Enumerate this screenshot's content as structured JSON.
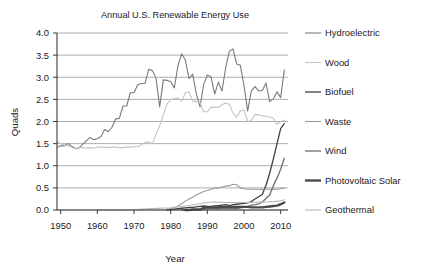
{
  "chart_data": {
    "type": "line",
    "title": "Annual U.S. Renewable  Energy Use",
    "xlabel": "Year",
    "ylabel": "Quads",
    "xlim": [
      1949,
      2012
    ],
    "ylim": [
      0.0,
      4.0
    ],
    "grid": true,
    "legend_position": "right",
    "x_ticks": [
      "1950",
      "1960",
      "1970",
      "1980",
      "1990",
      "2000",
      "2010"
    ],
    "x_tick_values": [
      1950,
      1960,
      1970,
      1980,
      1990,
      2000,
      2010
    ],
    "y_ticks": [
      "0.0",
      "0.5",
      "1.0",
      "1.5",
      "2.0",
      "2.5",
      "3.0",
      "3.5",
      "4.0"
    ],
    "y_tick_values": [
      0.0,
      0.5,
      1.0,
      1.5,
      2.0,
      2.5,
      3.0,
      3.5,
      4.0
    ],
    "series": [
      {
        "name": "Hydroelectric",
        "color": "#7a7a7a",
        "width": 1.1,
        "x": [
          1949,
          1950,
          1951,
          1952,
          1953,
          1954,
          1955,
          1956,
          1957,
          1958,
          1959,
          1960,
          1961,
          1962,
          1963,
          1964,
          1965,
          1966,
          1967,
          1968,
          1969,
          1970,
          1971,
          1972,
          1973,
          1974,
          1975,
          1976,
          1977,
          1978,
          1979,
          1980,
          1981,
          1982,
          1983,
          1984,
          1985,
          1986,
          1987,
          1988,
          1989,
          1990,
          1991,
          1992,
          1993,
          1994,
          1995,
          1996,
          1997,
          1998,
          1999,
          2000,
          2001,
          2002,
          2003,
          2004,
          2005,
          2006,
          2007,
          2008,
          2009,
          2010,
          2011
        ],
        "y": [
          1.42,
          1.45,
          1.45,
          1.5,
          1.44,
          1.39,
          1.4,
          1.49,
          1.56,
          1.64,
          1.59,
          1.61,
          1.66,
          1.82,
          1.77,
          1.87,
          2.06,
          2.07,
          2.35,
          2.35,
          2.65,
          2.65,
          2.83,
          2.86,
          2.86,
          3.18,
          3.15,
          2.98,
          2.33,
          2.94,
          2.93,
          2.9,
          2.76,
          3.27,
          3.53,
          3.39,
          2.97,
          3.07,
          2.63,
          2.33,
          2.84,
          3.05,
          3.01,
          2.62,
          2.89,
          2.69,
          3.21,
          3.59,
          3.64,
          3.3,
          3.27,
          2.81,
          2.24,
          2.69,
          2.79,
          2.69,
          2.7,
          2.87,
          2.45,
          2.51,
          2.67,
          2.54,
          3.17
        ]
      },
      {
        "name": "Wood",
        "color": "#c4c4c4",
        "width": 1.1,
        "x": [
          1949,
          1950,
          1951,
          1952,
          1953,
          1954,
          1955,
          1956,
          1957,
          1958,
          1959,
          1960,
          1961,
          1962,
          1963,
          1964,
          1965,
          1966,
          1967,
          1968,
          1969,
          1970,
          1971,
          1972,
          1973,
          1974,
          1975,
          1976,
          1977,
          1978,
          1979,
          1980,
          1981,
          1982,
          1983,
          1984,
          1985,
          1986,
          1987,
          1988,
          1989,
          1990,
          1991,
          1992,
          1993,
          1994,
          1995,
          1996,
          1997,
          1998,
          1999,
          2000,
          2001,
          2002,
          2003,
          2004,
          2005,
          2006,
          2007,
          2008,
          2009,
          2010,
          2011
        ],
        "y": [
          1.55,
          1.5,
          1.47,
          1.45,
          1.42,
          1.38,
          1.42,
          1.41,
          1.4,
          1.41,
          1.4,
          1.42,
          1.42,
          1.42,
          1.41,
          1.42,
          1.42,
          1.41,
          1.41,
          1.42,
          1.42,
          1.43,
          1.43,
          1.47,
          1.53,
          1.54,
          1.5,
          1.71,
          1.9,
          2.15,
          2.4,
          2.49,
          2.52,
          2.53,
          2.46,
          2.65,
          2.67,
          2.46,
          2.45,
          2.43,
          2.22,
          2.22,
          2.32,
          2.32,
          2.32,
          2.38,
          2.42,
          2.39,
          2.19,
          2.1,
          2.24,
          2.26,
          2.0,
          2.02,
          2.16,
          2.15,
          2.13,
          2.12,
          2.1,
          2.08,
          1.93,
          2.0,
          2.03
        ]
      },
      {
        "name": "Biofuel",
        "color": "#3f3f3f",
        "width": 1.3,
        "x": [
          1979,
          1980,
          1981,
          1982,
          1983,
          1984,
          1985,
          1986,
          1987,
          1988,
          1989,
          1990,
          1991,
          1992,
          1993,
          1994,
          1995,
          1996,
          1997,
          1998,
          1999,
          2000,
          2001,
          2002,
          2003,
          2004,
          2005,
          2006,
          2007,
          2008,
          2009,
          2010,
          2011
        ],
        "y": [
          0.0,
          0.01,
          0.02,
          0.03,
          0.04,
          0.05,
          0.06,
          0.06,
          0.07,
          0.08,
          0.09,
          0.08,
          0.08,
          0.09,
          0.1,
          0.11,
          0.12,
          0.1,
          0.12,
          0.13,
          0.14,
          0.15,
          0.16,
          0.19,
          0.25,
          0.3,
          0.35,
          0.56,
          0.83,
          1.15,
          1.5,
          1.84,
          1.95
        ]
      },
      {
        "name": "Waste",
        "color": "#9a9a9a",
        "width": 1.1,
        "x": [
          1979,
          1980,
          1981,
          1982,
          1983,
          1984,
          1985,
          1986,
          1987,
          1988,
          1989,
          1990,
          1991,
          1992,
          1993,
          1994,
          1995,
          1996,
          1997,
          1998,
          1999,
          2000,
          2001,
          2002,
          2003,
          2004,
          2005,
          2006,
          2007,
          2008,
          2009,
          2010,
          2011
        ],
        "y": [
          0.02,
          0.03,
          0.05,
          0.09,
          0.14,
          0.2,
          0.25,
          0.29,
          0.34,
          0.38,
          0.42,
          0.44,
          0.47,
          0.49,
          0.5,
          0.52,
          0.54,
          0.55,
          0.58,
          0.57,
          0.5,
          0.48,
          0.47,
          0.47,
          0.47,
          0.47,
          0.46,
          0.47,
          0.47,
          0.47,
          0.47,
          0.48,
          0.5
        ]
      },
      {
        "name": "Wind",
        "color": "#6e6e6e",
        "width": 1.3,
        "x": [
          1983,
          1984,
          1985,
          1986,
          1987,
          1988,
          1989,
          1990,
          1991,
          1992,
          1993,
          1994,
          1995,
          1996,
          1997,
          1998,
          1999,
          2000,
          2001,
          2002,
          2003,
          2004,
          2005,
          2006,
          2007,
          2008,
          2009,
          2010,
          2011
        ],
        "y": [
          0.0,
          0.0,
          0.01,
          0.01,
          0.01,
          0.01,
          0.02,
          0.03,
          0.03,
          0.03,
          0.03,
          0.04,
          0.03,
          0.03,
          0.03,
          0.03,
          0.05,
          0.06,
          0.07,
          0.11,
          0.12,
          0.14,
          0.18,
          0.26,
          0.34,
          0.55,
          0.72,
          0.92,
          1.17
        ]
      },
      {
        "name": "Photovoltaic Solar",
        "color": "#4a4a4a",
        "width": 2.4,
        "x": [
          1984,
          1985,
          1986,
          1987,
          1988,
          1989,
          1990,
          1991,
          1992,
          1993,
          1994,
          1995,
          1996,
          1997,
          1998,
          1999,
          2000,
          2001,
          2002,
          2003,
          2004,
          2005,
          2006,
          2007,
          2008,
          2009,
          2010,
          2011
        ],
        "y": [
          0.0,
          0.0,
          0.01,
          0.01,
          0.01,
          0.05,
          0.06,
          0.06,
          0.06,
          0.06,
          0.07,
          0.07,
          0.07,
          0.07,
          0.07,
          0.07,
          0.07,
          0.07,
          0.06,
          0.06,
          0.06,
          0.06,
          0.07,
          0.08,
          0.09,
          0.1,
          0.13,
          0.17
        ]
      },
      {
        "name": "Geothermal",
        "color": "#b8b8b8",
        "width": 1.1,
        "x": [
          1960,
          1965,
          1970,
          1975,
          1980,
          1985,
          1988,
          1990,
          1992,
          1994,
          1996,
          1998,
          2000,
          2002,
          2004,
          2006,
          2008,
          2010,
          2011
        ],
        "y": [
          0.0,
          0.0,
          0.01,
          0.03,
          0.05,
          0.1,
          0.14,
          0.17,
          0.18,
          0.17,
          0.17,
          0.17,
          0.17,
          0.17,
          0.18,
          0.18,
          0.19,
          0.21,
          0.23
        ]
      }
    ]
  },
  "legend": {
    "items": [
      {
        "label": "Hydroelectric"
      },
      {
        "label": "Wood"
      },
      {
        "label": "Biofuel"
      },
      {
        "label": "Waste"
      },
      {
        "label": "Wind"
      },
      {
        "label": "Photovoltaic Solar"
      },
      {
        "label": "Geothermal"
      }
    ]
  }
}
